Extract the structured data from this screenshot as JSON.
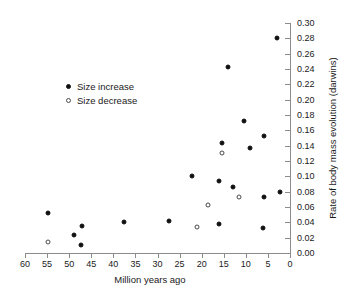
{
  "chart_data": {
    "type": "scatter",
    "title": "",
    "xlabel": "Million years ago",
    "ylabel": "Rate of body mass evolution (darwins)",
    "xlim": [
      60,
      0
    ],
    "ylim": [
      0.0,
      0.3
    ],
    "x_ticks": [
      60,
      55,
      50,
      45,
      40,
      35,
      30,
      25,
      20,
      15,
      10,
      5,
      0
    ],
    "x_tick_labels": [
      "60",
      "55",
      "50",
      "45",
      "40",
      "35",
      "30",
      "25",
      "20",
      "15",
      "10",
      "5",
      "0"
    ],
    "y_ticks": [
      0.0,
      0.02,
      0.04,
      0.06,
      0.08,
      0.1,
      0.12,
      0.14,
      0.16,
      0.18,
      0.2,
      0.22,
      0.24,
      0.26,
      0.28,
      0.3
    ],
    "y_tick_labels": [
      "0.00",
      "0.02",
      "0.04",
      "0.06",
      "0.08",
      "0.10",
      "0.12",
      "0.14",
      "0.16",
      "0.18",
      "0.20",
      "0.22",
      "0.24",
      "0.26",
      "0.28",
      "0.30"
    ],
    "x_axis_position": "bottom",
    "y_axis_position": "right",
    "x_axis_reversed": true,
    "grid": false,
    "legend_position": "upper-left-inside",
    "series": [
      {
        "name": "Size increase",
        "marker": "filled-circle",
        "color": "#111111",
        "points": [
          {
            "x": 54.8,
            "y": 0.052
          },
          {
            "x": 48.8,
            "y": 0.023
          },
          {
            "x": 47.2,
            "y": 0.035
          },
          {
            "x": 47.3,
            "y": 0.011
          },
          {
            "x": 37.5,
            "y": 0.04
          },
          {
            "x": 27.5,
            "y": 0.042
          },
          {
            "x": 22.2,
            "y": 0.101
          },
          {
            "x": 16.0,
            "y": 0.038
          },
          {
            "x": 16.0,
            "y": 0.094
          },
          {
            "x": 15.5,
            "y": 0.143
          },
          {
            "x": 14.0,
            "y": 0.242
          },
          {
            "x": 13.0,
            "y": 0.086
          },
          {
            "x": 10.5,
            "y": 0.172
          },
          {
            "x": 9.0,
            "y": 0.137
          },
          {
            "x": 6.2,
            "y": 0.032
          },
          {
            "x": 6.0,
            "y": 0.152
          },
          {
            "x": 6.0,
            "y": 0.073
          },
          {
            "x": 3.0,
            "y": 0.281
          },
          {
            "x": 2.2,
            "y": 0.08
          }
        ]
      },
      {
        "name": "Size decrease",
        "marker": "open-circle",
        "color": "#4a4a4a",
        "points": [
          {
            "x": 54.9,
            "y": 0.015
          },
          {
            "x": 21.0,
            "y": 0.034
          },
          {
            "x": 18.5,
            "y": 0.063
          },
          {
            "x": 15.3,
            "y": 0.13
          },
          {
            "x": 11.5,
            "y": 0.073
          }
        ]
      }
    ]
  },
  "legend": {
    "items": [
      {
        "label": "Size increase",
        "marker": "filled-circle"
      },
      {
        "label": "Size decrease",
        "marker": "open-circle"
      }
    ]
  }
}
